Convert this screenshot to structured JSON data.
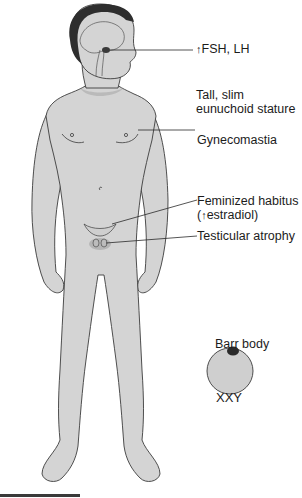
{
  "diagram": {
    "labels": {
      "hormones": {
        "arrow": "↑",
        "text": "FSH, LH"
      },
      "stature_line1": "Tall, slim",
      "stature_line2": "eunuchoid stature",
      "gynecomastia": "Gynecomastia",
      "feminized_line1": "Feminized habitus",
      "feminized_line2_prefix": "(",
      "feminized_line2_arrow": "↑",
      "feminized_line2_text": "estradiol)",
      "testicular": "Testicular atrophy",
      "barr_body": "Barr body",
      "karyotype": "XXY"
    },
    "colors": {
      "skin": "#d4d4d4",
      "outline": "#3c3c3c",
      "hair": "#2e2e2e",
      "shadow": "#a8a8a8",
      "cell": "#cfcfcf",
      "barr_body": "#2a2a2a",
      "leader_line": "#2a2a2a"
    }
  }
}
